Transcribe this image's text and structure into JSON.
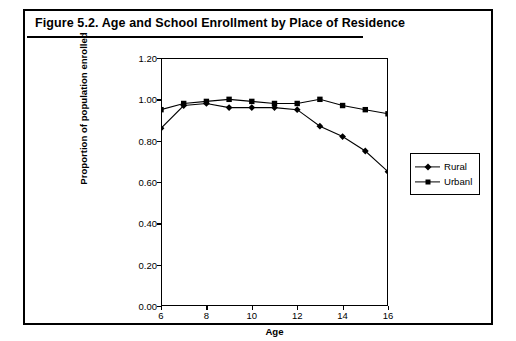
{
  "figure": {
    "title": "Figure 5.2.  Age and School Enrollment by Place of Residence"
  },
  "chart_data": {
    "type": "line",
    "title": "Figure 5.2.  Age and School Enrollment by Place of Residence",
    "xlabel": "Age",
    "ylabel": "Proportion of population enrolled",
    "x": [
      6,
      7,
      8,
      9,
      10,
      11,
      12,
      13,
      14,
      15,
      16
    ],
    "xlim": [
      6,
      16
    ],
    "ylim": [
      0.0,
      1.2
    ],
    "xticks": [
      "6",
      "8",
      "10",
      "12",
      "14",
      "16"
    ],
    "xtick_values": [
      6,
      8,
      10,
      12,
      14,
      16
    ],
    "yticks": [
      "0.00",
      "0.20",
      "0.40",
      "0.60",
      "0.80",
      "1.00",
      "1.20"
    ],
    "ytick_values": [
      0.0,
      0.2,
      0.4,
      0.6,
      0.8,
      1.0,
      1.2
    ],
    "grid": false,
    "legend_position": "right",
    "series": [
      {
        "name": "Rural",
        "marker": "diamond",
        "color": "#000000",
        "values": [
          0.86,
          0.97,
          0.98,
          0.96,
          0.96,
          0.96,
          0.95,
          0.87,
          0.82,
          0.75,
          0.65
        ]
      },
      {
        "name": "Urbanl",
        "marker": "square",
        "color": "#000000",
        "values": [
          0.95,
          0.98,
          0.99,
          1.0,
          0.99,
          0.98,
          0.98,
          1.0,
          0.97,
          0.95,
          0.93
        ]
      }
    ]
  }
}
